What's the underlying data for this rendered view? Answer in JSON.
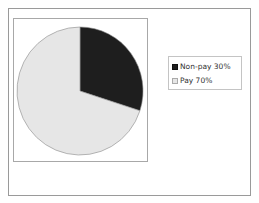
{
  "chart_data": {
    "type": "pie",
    "title": "",
    "categories": [
      "Non-pay",
      "Pay"
    ],
    "values": [
      30,
      70
    ],
    "unit": "%",
    "colors": [
      "#1e1e1e",
      "#e6e6e6"
    ],
    "legend": {
      "position": "right",
      "entries": [
        "Non-pay 30%",
        "Pay 70%"
      ]
    },
    "start_angle_deg": 0,
    "direction": "clockwise"
  },
  "legend": {
    "items": [
      {
        "label": "Non-pay 30%",
        "color": "#1e1e1e"
      },
      {
        "label": "Pay 70%",
        "color": "#e6e6e6"
      }
    ]
  }
}
